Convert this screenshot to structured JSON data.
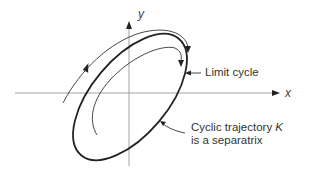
{
  "diagram": {
    "axes": {
      "x_label": "x",
      "y_label": "y"
    },
    "annotations": {
      "limit_cycle": "Limit cycle",
      "separatrix_line1_prefix": "Cyclic trajectory ",
      "separatrix_symbol": "K",
      "separatrix_line2": "is a separatrix"
    },
    "colors": {
      "stroke": "#222222",
      "axis": "#888888",
      "text": "#333333"
    }
  }
}
